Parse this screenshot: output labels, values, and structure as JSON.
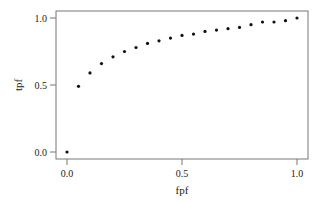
{
  "chart_data": {
    "type": "scatter",
    "title": "",
    "xlabel": "fpf",
    "ylabel": "tpf",
    "xlim": [
      0,
      1
    ],
    "ylim": [
      0,
      1
    ],
    "grid": false,
    "legend": null,
    "x_ticks": [
      "0.0",
      "0.5",
      "1.0"
    ],
    "y_ticks": [
      "0.0",
      "0.5",
      "1.0"
    ],
    "x": [
      0.0,
      0.05,
      0.1,
      0.15,
      0.2,
      0.25,
      0.3,
      0.35,
      0.4,
      0.45,
      0.5,
      0.55,
      0.6,
      0.65,
      0.7,
      0.75,
      0.8,
      0.85,
      0.9,
      0.95,
      1.0
    ],
    "y": [
      0.0,
      0.49,
      0.59,
      0.66,
      0.71,
      0.75,
      0.78,
      0.81,
      0.83,
      0.85,
      0.87,
      0.88,
      0.9,
      0.91,
      0.92,
      0.93,
      0.95,
      0.97,
      0.97,
      0.98,
      1.0
    ],
    "colors": {
      "points": "#111111",
      "axis": "#777777"
    }
  }
}
